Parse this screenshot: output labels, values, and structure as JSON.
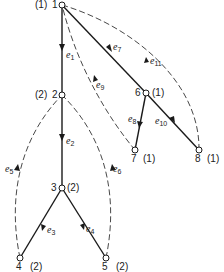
{
  "diagram": {
    "type": "spanning tree with back edges",
    "nodes": [
      {
        "id": "1",
        "weight": "(1)",
        "label": "1"
      },
      {
        "id": "2",
        "weight": "(2)",
        "label": "2"
      },
      {
        "id": "3",
        "weight": "(2)",
        "label": "3"
      },
      {
        "id": "4",
        "weight": "(2)",
        "label": "4"
      },
      {
        "id": "5",
        "weight": "(2)",
        "label": "5"
      },
      {
        "id": "6",
        "weight": "(1)",
        "label": "6"
      },
      {
        "id": "7",
        "weight": "(1)",
        "label": "7"
      },
      {
        "id": "8",
        "weight": "(1)",
        "label": "8"
      }
    ],
    "edges": [
      {
        "name": "e",
        "sub": "1",
        "from": "1",
        "to": "2",
        "style": "solid"
      },
      {
        "name": "e",
        "sub": "2",
        "from": "2",
        "to": "3",
        "style": "solid"
      },
      {
        "name": "e",
        "sub": "3",
        "from": "3",
        "to": "4",
        "style": "solid"
      },
      {
        "name": "e",
        "sub": "4",
        "from": "3",
        "to": "5",
        "style": "solid"
      },
      {
        "name": "e",
        "sub": "5",
        "from": "4",
        "to": "2",
        "style": "dashed"
      },
      {
        "name": "e",
        "sub": "6",
        "from": "5",
        "to": "2",
        "style": "dashed"
      },
      {
        "name": "e",
        "sub": "7",
        "from": "1",
        "to": "6",
        "style": "solid"
      },
      {
        "name": "e",
        "sub": "8",
        "from": "6",
        "to": "7",
        "style": "solid"
      },
      {
        "name": "e",
        "sub": "9",
        "from": "7",
        "to": "1",
        "style": "dashed"
      },
      {
        "name": "e",
        "sub": "10",
        "from": "6",
        "to": "8",
        "style": "solid"
      },
      {
        "name": "e",
        "sub": "11",
        "from": "8",
        "to": "1",
        "style": "dashed"
      }
    ]
  }
}
